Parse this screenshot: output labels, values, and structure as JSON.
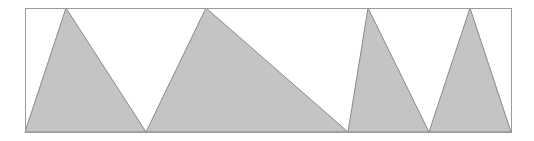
{
  "diagram": {
    "frame": {
      "x": 25,
      "y": 8,
      "width": 486,
      "height": 124,
      "stroke": "#9a9a9a"
    },
    "fill_color": "#c4c4c4",
    "edge_color": "#8a8a8a",
    "triangles": [
      {
        "points": [
          [
            25,
            132
          ],
          [
            66,
            8
          ],
          [
            146,
            132
          ]
        ]
      },
      {
        "points": [
          [
            146,
            132
          ],
          [
            206,
            8
          ],
          [
            348,
            132
          ]
        ]
      },
      {
        "points": [
          [
            348,
            132
          ],
          [
            368,
            8
          ],
          [
            429,
            132
          ]
        ]
      },
      {
        "points": [
          [
            429,
            132
          ],
          [
            470,
            8
          ],
          [
            511,
            132
          ]
        ]
      }
    ]
  }
}
